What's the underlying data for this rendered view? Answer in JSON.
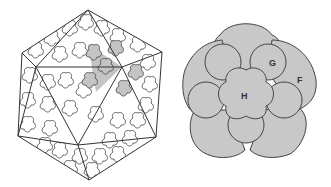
{
  "figure": {
    "left_panel": {
      "subject": "icosahedral-capsid",
      "vertices": {
        "top": [
          88,
          10
        ],
        "upper_left": [
          22,
          53
        ],
        "upper_right": [
          162,
          52
        ],
        "lower_left": [
          18,
          136
        ],
        "lower_right": [
          156,
          137
        ],
        "bottom": [
          89,
          180
        ],
        "inner_top_left": [
          36,
          67
        ],
        "inner_top_right": [
          122,
          67
        ],
        "inner_bottom": [
          78,
          145
        ]
      },
      "highlight_color": "#c4c4c4"
    },
    "right_panel": {
      "subject": "capsomer-rosette",
      "center": [
        246,
        95
      ],
      "fill_color": "#c8c8c8",
      "labels": {
        "g": {
          "text": "G",
          "x": 269,
          "y": 66
        },
        "f": {
          "text": "F",
          "x": 297,
          "y": 83
        },
        "h": {
          "text": "H",
          "x": 245,
          "y": 99
        }
      }
    }
  }
}
